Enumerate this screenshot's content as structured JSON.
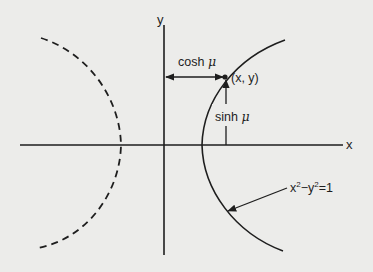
{
  "diagram": {
    "axes": {
      "x_label": "x",
      "y_label": "y"
    },
    "point_label": "(x, y)",
    "horizontal_measure": {
      "label": "cosh",
      "symbol": "μ"
    },
    "vertical_measure": {
      "label": "sinh",
      "symbol": "μ"
    },
    "curve_label": {
      "prefix": "x",
      "sup1": "2",
      "minus": "−y",
      "sup2": "2",
      "suffix": "=1"
    },
    "curves": [
      {
        "name": "right-branch",
        "style": "solid"
      },
      {
        "name": "left-branch",
        "style": "dashed"
      }
    ],
    "colors": {
      "background": "#ececea",
      "ink": "#1e1e1e"
    }
  }
}
